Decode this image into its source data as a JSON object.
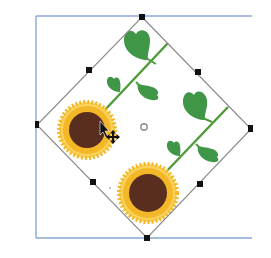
{
  "canvas": {
    "width": 271,
    "height": 258,
    "background": "#ffffff"
  },
  "artboard_frame": {
    "color": "#8aa7d6",
    "x": 36,
    "top": 16,
    "bottom": 238,
    "right": 252
  },
  "selection": {
    "bounding_box_color": "#8c8c8c",
    "handle_color": "#111111",
    "corners": {
      "top": [
        142,
        17
      ],
      "right": [
        251,
        129
      ],
      "bottom": [
        147,
        238
      ],
      "left": [
        37,
        125
      ]
    },
    "handles": [
      {
        "name": "top",
        "x": 142,
        "y": 17
      },
      {
        "name": "top-right-mid",
        "x": 198,
        "y": 72
      },
      {
        "name": "right",
        "x": 251,
        "y": 129
      },
      {
        "name": "bottom-right-mid",
        "x": 200,
        "y": 184
      },
      {
        "name": "bottom",
        "x": 147,
        "y": 238
      },
      {
        "name": "bottom-left-mid",
        "x": 93,
        "y": 182
      },
      {
        "name": "left",
        "x": 37,
        "y": 125
      },
      {
        "name": "top-left-mid",
        "x": 89,
        "y": 70
      }
    ],
    "center_point": {
      "x": 144,
      "y": 127
    }
  },
  "artwork": {
    "petal_color": "#f4b728",
    "petal_light_color": "#f8d25a",
    "disk_color": "#5a2e1f",
    "stem_color": "#4f9a3a",
    "leaf_color": "#3f9647",
    "sunflowers": [
      {
        "name": "sunflower-upper-left",
        "cx": 87,
        "cy": 130,
        "r_outer": 28,
        "r_disk": 18
      },
      {
        "name": "sunflower-lower",
        "cx": 148,
        "cy": 193,
        "r_outer": 29,
        "r_disk": 19
      }
    ],
    "stems": [
      {
        "name": "stem-upper",
        "x1": 103,
        "y1": 112,
        "x2": 168,
        "y2": 43
      },
      {
        "name": "stem-lower",
        "x1": 164,
        "y1": 174,
        "x2": 228,
        "y2": 107
      }
    ]
  },
  "cursor": {
    "arrow_icon": "arrow-pointer-icon",
    "move_icon": "move-cursor-icon",
    "arrow": {
      "x": 100,
      "y": 121
    },
    "move": {
      "x": 113,
      "y": 137
    }
  },
  "labels": {
    "aria": "Rotated sunflower pattern selected on artboard"
  }
}
